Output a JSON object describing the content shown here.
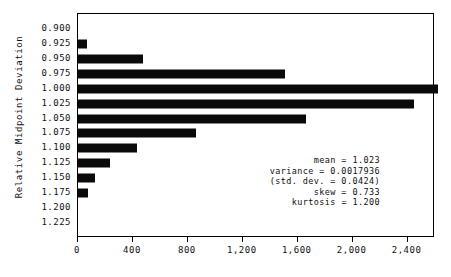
{
  "chart_data": {
    "type": "bar",
    "orientation": "horizontal",
    "title": "",
    "subtitle": "",
    "xlabel": "",
    "ylabel": "Relative Midpoint Deviation",
    "categories": [
      "0.900",
      "0.925",
      "0.950",
      "0.975",
      "1.000",
      "1.025",
      "1.050",
      "1.075",
      "1.100",
      "1.125",
      "1.150",
      "1.175",
      "1.200",
      "1.225"
    ],
    "values": [
      0,
      65,
      470,
      1510,
      2620,
      2450,
      1660,
      860,
      430,
      235,
      125,
      70,
      0,
      0
    ],
    "xtick_labels": [
      "0",
      "400",
      "800",
      "1,200",
      "1,600",
      "2,000",
      "2,400"
    ],
    "xtick_values": [
      0,
      400,
      800,
      1200,
      1600,
      2000,
      2400
    ],
    "xlim": [
      0,
      2600
    ],
    "ylim_categories": [
      "0.900",
      "1.225"
    ],
    "grid": false,
    "legend": "none",
    "bar_color": "#0a0a0a",
    "frame_color": "#000000",
    "background_color": "#ffffff",
    "annotations": [
      "mean = 1.023",
      "variance = 0.0017936",
      "(std. dev. = 0.0424)",
      "skew = 0.733",
      "kurtosis = 1.200"
    ],
    "statistics": {
      "mean": "1.023",
      "variance": "0.0017936",
      "std_dev": "0.0424",
      "skew": "0.733",
      "kurtosis": "1.200"
    }
  }
}
